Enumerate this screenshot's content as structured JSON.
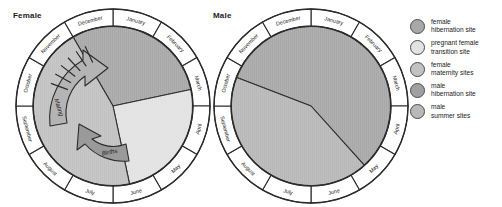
{
  "figure": {
    "background": "#ffffff",
    "stroke": "#2b2b2b"
  },
  "charts": [
    {
      "id": "female",
      "title": "Female",
      "cx": 113,
      "cy": 106,
      "outer_r": 97,
      "ring_inner_r": 80,
      "months": [
        "January",
        "February",
        "March",
        "April",
        "May",
        "June",
        "July",
        "August",
        "September",
        "October",
        "November",
        "December"
      ],
      "sectors": [
        {
          "name": "female hibernation site",
          "start_month": 11.0,
          "end_month": 2.6,
          "color": "#a8a8a8"
        },
        {
          "name": "pregnant female transition site",
          "start_month": 2.6,
          "end_month": 5.6,
          "color": "#e2e2e2"
        },
        {
          "name": "female maternity sites",
          "start_month": 5.6,
          "end_month": 11.0,
          "color": "#c2c2c2"
        }
      ],
      "annotations": [
        {
          "label": "Mating",
          "type": "curved-arrow",
          "direction": "clockwise",
          "color": "#b4b4b4",
          "hatched": true
        },
        {
          "label": "Births",
          "type": "curved-arrow",
          "direction": "counterclockwise",
          "color": "#9a9a9a",
          "hatched": false
        }
      ]
    },
    {
      "id": "male",
      "title": "Male",
      "cx": 311,
      "cy": 106,
      "outer_r": 97,
      "ring_inner_r": 80,
      "months": [
        "January",
        "February",
        "March",
        "April",
        "May",
        "June",
        "July",
        "August",
        "September",
        "October",
        "November",
        "December"
      ],
      "sectors": [
        {
          "name": "male hibernation site",
          "start_month": 9.7,
          "end_month": 4.6,
          "color": "#a8a8a8"
        },
        {
          "name": "male summer sites",
          "start_month": 4.6,
          "end_month": 9.7,
          "color": "#b8b8b8"
        }
      ],
      "annotations": []
    }
  ],
  "legend": {
    "items": [
      {
        "line1": "female",
        "line2": "hibernation site",
        "color": "#a8a8a8"
      },
      {
        "line1": "pregnant female",
        "line2": "transition site",
        "color": "#e2e2e2"
      },
      {
        "line1": "female",
        "line2": "maternity sites",
        "color": "#c2c2c2"
      },
      {
        "line1": "male",
        "line2": "hibernation site",
        "color": "#a0a0a0"
      },
      {
        "line1": "male",
        "line2": "summer sites",
        "color": "#b8b8b8"
      }
    ]
  },
  "chart_data": {
    "type": "pie",
    "xlabel": "",
    "ylabel": "",
    "grid": false,
    "legend_position": "right",
    "units": "months of the year",
    "categories": [
      "January",
      "February",
      "March",
      "April",
      "May",
      "June",
      "July",
      "August",
      "September",
      "October",
      "November",
      "December"
    ],
    "series": [
      {
        "name": "Female",
        "slices": [
          {
            "label": "female hibernation site",
            "start_month": "November",
            "end_month": "mid-March",
            "value_months": 3.6,
            "color": "#a8a8a8"
          },
          {
            "label": "pregnant female transition site",
            "start_month": "mid-March",
            "end_month": "mid-June",
            "value_months": 3.0,
            "color": "#e2e2e2"
          },
          {
            "label": "female maternity sites",
            "start_month": "mid-June",
            "end_month": "November",
            "value_months": 5.4,
            "color": "#c2c2c2"
          }
        ],
        "annotations": [
          {
            "label": "Mating",
            "period": "October - November"
          },
          {
            "label": "Births",
            "period": "June - July"
          }
        ]
      },
      {
        "name": "Male",
        "slices": [
          {
            "label": "male hibernation site",
            "start_month": "early October",
            "end_month": "mid-May",
            "value_months": 6.9,
            "color": "#a8a8a8"
          },
          {
            "label": "male summer sites",
            "start_month": "mid-May",
            "end_month": "early October",
            "value_months": 5.1,
            "color": "#b8b8b8"
          }
        ],
        "annotations": []
      }
    ]
  }
}
